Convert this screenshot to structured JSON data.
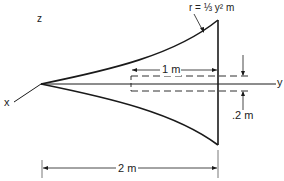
{
  "diagram": {
    "labels": {
      "z_axis": "z",
      "x_axis": "x",
      "y_axis": "y",
      "curve_equation": "r = ⅓ y² m",
      "one_meter": "1 m",
      "thickness": ".2 m",
      "two_meter": "2 m"
    },
    "colors": {
      "line": "#1a1a1a",
      "background": "#ffffff"
    },
    "geometry": {
      "total_length_m": 2,
      "inner_length_m": 1,
      "inner_width_m": 0.2,
      "profile": "r = y^2/3"
    }
  }
}
